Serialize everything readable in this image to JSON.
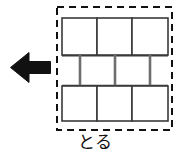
{
  "figure": {
    "caption": "とる",
    "caption_meaning_icon": "remove-action-label",
    "background_color": "#ffffff"
  },
  "arrow": {
    "icon": "arrow-left-icon",
    "direction": "left",
    "color": "#111111",
    "x": 10,
    "y": 52,
    "width": 41,
    "height": 31
  },
  "selection_region": {
    "name": "dashed-selection-box",
    "style": "dashed",
    "color": "#111111",
    "stroke_width": 2,
    "dash": "7 5",
    "x": 57,
    "y": 7,
    "width": 115,
    "height": 123
  },
  "brick_wall": {
    "fill": "#ffffff",
    "stroke": "#3a3a3a",
    "stroke_width": 1.6,
    "mortar_color": "#6e6e6e",
    "rows": [
      {
        "name": "top-row",
        "y": 18,
        "height": 37,
        "x": 62,
        "blocks": [
          {
            "label": "",
            "x": 62,
            "width": 35
          },
          {
            "label": "",
            "x": 97,
            "width": 35
          },
          {
            "label": "",
            "x": 132,
            "width": 36
          }
        ]
      },
      {
        "name": "middle-row",
        "y": 56,
        "height": 29,
        "x": 80,
        "offset": true,
        "blocks": [
          {
            "label": "",
            "x": 80,
            "width": 35
          },
          {
            "label": "",
            "x": 115,
            "width": 35
          }
        ]
      },
      {
        "name": "bottom-row",
        "y": 86,
        "height": 35,
        "x": 62,
        "blocks": [
          {
            "label": "",
            "x": 62,
            "width": 35
          },
          {
            "label": "",
            "x": 97,
            "width": 35
          },
          {
            "label": "",
            "x": 132,
            "width": 36
          }
        ]
      }
    ],
    "total_blocks": 8
  }
}
